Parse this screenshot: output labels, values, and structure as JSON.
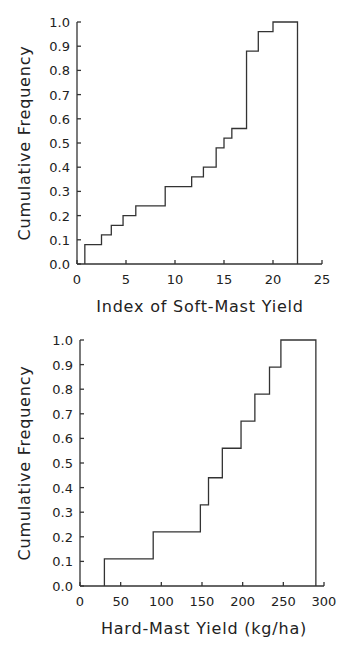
{
  "chart_data": [
    {
      "type": "line",
      "subtype": "step-cumulative",
      "title": "",
      "xlabel": "Index of Soft-Mast Yield",
      "ylabel": "Cumulative Frequency",
      "xlim": [
        0,
        25
      ],
      "ylim": [
        0.0,
        1.0
      ],
      "xticks": [
        "0",
        "5",
        "10",
        "15",
        "20",
        "25"
      ],
      "yticks": [
        "0.0",
        "0.1",
        "0.2",
        "0.3",
        "0.4",
        "0.5",
        "0.6",
        "0.7",
        "0.8",
        "0.9",
        "1.0"
      ],
      "grid": false,
      "legend": null,
      "x": [
        0.8,
        2.5,
        3.5,
        4.7,
        6.0,
        9.0,
        11.7,
        12.9,
        14.2,
        15.0,
        15.8,
        17.3,
        18.5,
        20.0,
        22.5
      ],
      "y": [
        0.08,
        0.12,
        0.16,
        0.2,
        0.24,
        0.32,
        0.36,
        0.4,
        0.48,
        0.52,
        0.56,
        0.88,
        0.96,
        1.0,
        1.0
      ]
    },
    {
      "type": "line",
      "subtype": "step-cumulative",
      "title": "",
      "xlabel": "Hard-Mast Yield (kg/ha)",
      "ylabel": "Cumulative Frequency",
      "xlim": [
        0,
        300
      ],
      "ylim": [
        0.0,
        1.0
      ],
      "xticks": [
        "0",
        "50",
        "100",
        "150",
        "200",
        "250",
        "300"
      ],
      "yticks": [
        "0.0",
        "0.1",
        "0.2",
        "0.3",
        "0.4",
        "0.5",
        "0.6",
        "0.7",
        "0.8",
        "0.9",
        "1.0"
      ],
      "grid": false,
      "legend": null,
      "x": [
        30,
        90,
        148,
        158,
        175,
        198,
        215,
        233,
        247,
        290
      ],
      "y": [
        0.11,
        0.22,
        0.33,
        0.44,
        0.56,
        0.67,
        0.78,
        0.89,
        1.0,
        1.0
      ]
    }
  ]
}
